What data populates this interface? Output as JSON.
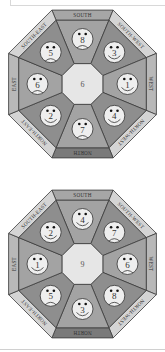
{
  "colors": {
    "band_north": "#7a7a7a",
    "band_south": "#a6a6a6",
    "band_east_west": "#b8b8b8",
    "band_diagonal": "#d4d4d4",
    "wedge_dark": "#8e8e8e",
    "wedge_light": "#a3a3a3",
    "hub": "#e6e6e6",
    "face": "#eeeeee"
  },
  "directions": [
    "SOUTH",
    "SOUTH-WEST",
    "WEST",
    "NORTH-WEST",
    "NORTH",
    "NORTH-EAST",
    "EAST",
    "SOUTH-EAST"
  ],
  "octagons": [
    {
      "center_number": "6",
      "faces": [
        {
          "position": "SOUTH",
          "number": "8",
          "mood": "sad"
        },
        {
          "position": "SOUTH-WEST",
          "number": "3",
          "mood": "happy"
        },
        {
          "position": "WEST",
          "number": "1",
          "mood": "happy"
        },
        {
          "position": "NORTH-WEST",
          "number": "4",
          "mood": "happy"
        },
        {
          "position": "NORTH",
          "number": "7",
          "mood": "sad"
        },
        {
          "position": "NORTH-EAST",
          "number": "2",
          "mood": "happy"
        },
        {
          "position": "EAST",
          "number": "6",
          "mood": "sad"
        },
        {
          "position": "SOUTH-EAST",
          "number": "5",
          "mood": "sad"
        }
      ]
    },
    {
      "center_number": "9",
      "faces": [
        {
          "position": "SOUTH",
          "number": "4",
          "mood": "happy"
        },
        {
          "position": "SOUTH-WEST",
          "number": "7",
          "mood": "sad"
        },
        {
          "position": "WEST",
          "number": "6",
          "mood": "sad"
        },
        {
          "position": "NORTH-WEST",
          "number": "8",
          "mood": "sad"
        },
        {
          "position": "NORTH",
          "number": "3",
          "mood": "happy"
        },
        {
          "position": "NORTH-EAST",
          "number": "5",
          "mood": "sad"
        },
        {
          "position": "EAST",
          "number": "1",
          "mood": "happy"
        },
        {
          "position": "SOUTH-EAST",
          "number": "2",
          "mood": "happy"
        }
      ]
    }
  ]
}
